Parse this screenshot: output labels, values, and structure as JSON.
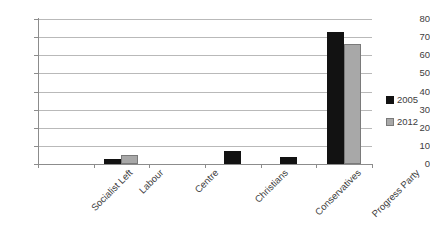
{
  "chart_data": {
    "type": "bar",
    "title": "",
    "xlabel": "",
    "ylabel": "",
    "ylim": [
      0,
      80
    ],
    "ytick_step": 10,
    "yticks": [
      80,
      70,
      60,
      50,
      40,
      30,
      20,
      10,
      0
    ],
    "grid": true,
    "legend_position": "right",
    "categories": [
      "Socialist Left",
      "Labour",
      "Centre",
      "Christians",
      "Conservatives",
      "Progress Party"
    ],
    "series": [
      {
        "name": "2005",
        "color": "#121212",
        "values": [
          0,
          3,
          0,
          7,
          4,
          73
        ]
      },
      {
        "name": "2012",
        "color": "#a8a8a8",
        "values": [
          0,
          5,
          0,
          0,
          0,
          66
        ]
      }
    ]
  },
  "legend": {
    "items": [
      {
        "label": "2005"
      },
      {
        "label": "2012"
      }
    ]
  }
}
